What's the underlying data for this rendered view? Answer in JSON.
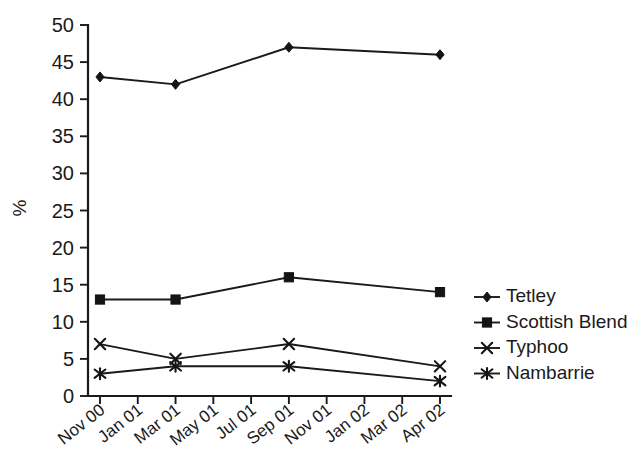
{
  "chart_data": {
    "type": "line",
    "title": "",
    "subtitle": "",
    "xlabel": "",
    "ylabel": "%",
    "ylim": [
      0,
      50
    ],
    "y_ticks": [
      0,
      5,
      10,
      15,
      20,
      25,
      30,
      35,
      40,
      45,
      50
    ],
    "grid": false,
    "legend_position": "right",
    "categories": [
      "Nov 00",
      "Jan 01",
      "Mar 01",
      "May 01",
      "Jul 01",
      "Sep 01",
      "Nov 01",
      "Jan 02",
      "Mar 02",
      "Apr 02"
    ],
    "x_tick_labels": [
      "Nov 00",
      "Jan 01",
      "Mar 01",
      "May 01",
      "Jul 01",
      "Sep 01",
      "Nov 01",
      "Jan 02",
      "Mar 02",
      "Apr 02"
    ],
    "series": [
      {
        "name": "Tetley",
        "marker": "diamond",
        "color": "#1a1a1a",
        "x": [
          "Nov 00",
          "Mar 01",
          "Sep 01",
          "Apr 02"
        ],
        "x_index": [
          0,
          2,
          5,
          9
        ],
        "values": [
          43,
          42,
          47,
          46
        ]
      },
      {
        "name": "Scottish Blend",
        "marker": "square",
        "color": "#1a1a1a",
        "x": [
          "Nov 00",
          "Mar 01",
          "Sep 01",
          "Apr 02"
        ],
        "x_index": [
          0,
          2,
          5,
          9
        ],
        "values": [
          13,
          13,
          16,
          14
        ]
      },
      {
        "name": "Typhoo",
        "marker": "x",
        "color": "#1a1a1a",
        "x": [
          "Nov 00",
          "Mar 01",
          "Sep 01",
          "Apr 02"
        ],
        "x_index": [
          0,
          2,
          5,
          9
        ],
        "values": [
          7,
          5,
          7,
          4
        ]
      },
      {
        "name": "Nambarrie",
        "marker": "asterisk",
        "color": "#1a1a1a",
        "x": [
          "Nov 00",
          "Mar 01",
          "Sep 01",
          "Apr 02"
        ],
        "x_index": [
          0,
          2,
          5,
          9
        ],
        "values": [
          3,
          4,
          4,
          2
        ]
      }
    ]
  },
  "legend": {
    "entries": [
      {
        "label": "Tetley",
        "marker": "diamond"
      },
      {
        "label": "Scottish Blend",
        "marker": "square"
      },
      {
        "label": "Typhoo",
        "marker": "x"
      },
      {
        "label": "Nambarrie",
        "marker": "asterisk"
      }
    ]
  },
  "axes": {
    "y_title": "%"
  },
  "colors": {
    "ink": "#1a1a1a",
    "background": "#ffffff"
  }
}
